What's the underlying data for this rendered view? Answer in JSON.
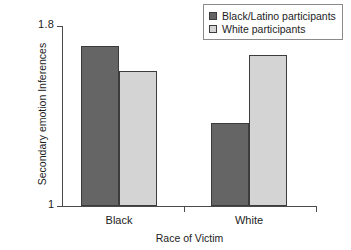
{
  "chart_data": {
    "type": "bar",
    "title": "",
    "xlabel": "Race of Victim",
    "ylabel": "Secondary emotion Inferences",
    "categories": [
      "Black",
      "White"
    ],
    "ylim": [
      1,
      1.8
    ],
    "ytick_labels": [
      "1.8",
      "1"
    ],
    "grid": false,
    "legend_position": "top-right",
    "series": [
      {
        "name": "Black/Latino participants",
        "color": "#656565",
        "values": [
          1.71,
          1.37
        ]
      },
      {
        "name": "White participants",
        "color": "#d4d4d4",
        "values": [
          1.6,
          1.67
        ]
      }
    ]
  },
  "axes": {
    "y_label": "Secondary emotion Inferences",
    "y_max_label": "1.8",
    "y_min_label": "1",
    "x_label": "Race of Victim",
    "x_cat_0": "Black",
    "x_cat_1": "White"
  },
  "legend": {
    "items": [
      {
        "label": "Black/Latino participants",
        "color": "#656565"
      },
      {
        "label": "White participants",
        "color": "#d4d4d4"
      }
    ]
  }
}
